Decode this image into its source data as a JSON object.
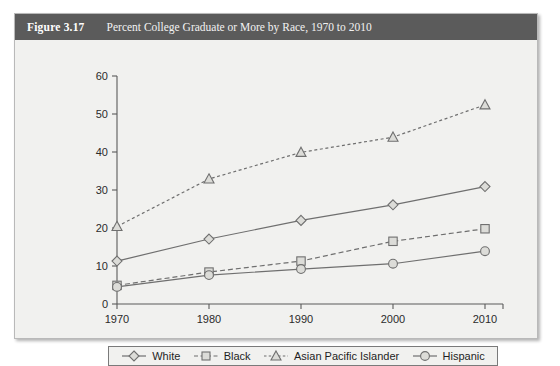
{
  "figure": {
    "number_label": "Figure 3.17",
    "title": "Percent College Graduate or More by Race, 1970 to 2010"
  },
  "legend": {
    "items": [
      {
        "label": "White",
        "marker": "diamond-marker-icon",
        "style": "solid"
      },
      {
        "label": "Black",
        "marker": "square-marker-icon",
        "style": "dashed"
      },
      {
        "label": "Asian Pacific Islander",
        "marker": "triangle-marker-icon",
        "style": "dotted"
      },
      {
        "label": "Hispanic",
        "marker": "circle-marker-icon",
        "style": "solid"
      }
    ]
  },
  "axes": {
    "y_ticks": [
      "0",
      "10",
      "20",
      "30",
      "40",
      "50",
      "60"
    ],
    "x_ticks": [
      "1970",
      "1980",
      "1990",
      "2000",
      "2010"
    ]
  },
  "colors": {
    "header_bg": "#5b5b5b",
    "panel_bg": "#f1f1ef",
    "line": "#6f6f6f",
    "marker_fill": "#dcdcd8",
    "axis": "#5a5a5a"
  },
  "chart_data": {
    "type": "line",
    "title": "Percent College Graduate or More by Race, 1970 to 2010",
    "xlabel": "",
    "ylabel": "",
    "x": [
      1970,
      1980,
      1990,
      2000,
      2010
    ],
    "categories": [
      "1970",
      "1980",
      "1990",
      "2000",
      "2010"
    ],
    "ylim": [
      0,
      60
    ],
    "yticks": [
      0,
      10,
      20,
      30,
      40,
      50,
      60
    ],
    "grid": false,
    "legend_position": "bottom",
    "series": [
      {
        "name": "White",
        "values": [
          11.3,
          17.1,
          22.0,
          26.1,
          30.9
        ],
        "marker": "diamond",
        "linestyle": "solid"
      },
      {
        "name": "Black",
        "values": [
          4.9,
          8.4,
          11.3,
          16.5,
          19.8
        ],
        "marker": "square",
        "linestyle": "dashed"
      },
      {
        "name": "Asian Pacific Islander",
        "values": [
          20.4,
          32.9,
          39.9,
          43.9,
          52.4
        ],
        "marker": "triangle",
        "linestyle": "dotted"
      },
      {
        "name": "Hispanic",
        "values": [
          4.5,
          7.6,
          9.2,
          10.6,
          13.9
        ],
        "marker": "circle",
        "linestyle": "solid"
      }
    ]
  }
}
